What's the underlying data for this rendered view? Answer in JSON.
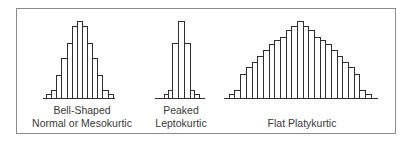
{
  "chart_data": [
    {
      "type": "bar",
      "title": "Bell-Shaped Normal or Mesokurtic",
      "label_lines": [
        "Bell-Shaped",
        "Normal or Mesokurtic"
      ],
      "categories": [
        "1",
        "2",
        "3",
        "4",
        "5",
        "6",
        "7",
        "8",
        "9",
        "10",
        "11",
        "12",
        "13"
      ],
      "values": [
        4,
        8,
        23,
        40,
        55,
        72,
        77,
        72,
        55,
        40,
        23,
        8,
        4
      ],
      "xlabel": "",
      "ylabel": "",
      "grid": false,
      "layout": {
        "x_start": 46,
        "bar_width": 5.13,
        "baseline_y": 98,
        "axis_from": 43,
        "axis_to": 115,
        "label_center": 82
      }
    },
    {
      "type": "bar",
      "title": "Peaked Leptokurtic",
      "label_lines": [
        "Peaked",
        "Leptokurtic"
      ],
      "categories": [
        "1",
        "2",
        "3",
        "4",
        "5",
        "6",
        "7"
      ],
      "values": [
        4,
        8,
        55,
        77,
        55,
        8,
        4
      ],
      "xlabel": "",
      "ylabel": "",
      "grid": false,
      "layout": {
        "x_start": 164,
        "bar_widths": [
          4,
          4.3,
          6,
          5.7,
          6,
          4.3,
          4.4
        ],
        "baseline_y": 98,
        "axis_from": 155,
        "axis_to": 205,
        "label_center": 181
      }
    },
    {
      "type": "bar",
      "title": "Flat Platykurtic",
      "label_lines": [
        "Flat Platykurtic"
      ],
      "categories": [
        "1",
        "2",
        "3",
        "4",
        "5",
        "6",
        "7",
        "8",
        "9",
        "10",
        "11",
        "12",
        "13",
        "14",
        "15",
        "16",
        "17",
        "18",
        "19",
        "20",
        "21",
        "22",
        "23",
        "24",
        "25"
      ],
      "values": [
        4,
        8,
        24,
        31,
        36,
        42,
        48,
        54,
        58,
        61,
        68,
        72,
        77,
        72,
        68,
        61,
        58,
        54,
        48,
        42,
        36,
        31,
        24,
        8,
        4
      ],
      "xlabel": "",
      "ylabel": "",
      "grid": false,
      "layout": {
        "x_start": 228.8,
        "bar_width": 5.68,
        "baseline_y": 98,
        "axis_from": 224,
        "axis_to": 378,
        "label_center": 302
      }
    }
  ],
  "labels": {
    "bell_line1": "Bell-Shaped",
    "bell_line2": "Normal or Mesokurtic",
    "peaked_line1": "Peaked",
    "peaked_line2": "Leptokurtic",
    "flat_line1": "Flat Platykurtic"
  }
}
